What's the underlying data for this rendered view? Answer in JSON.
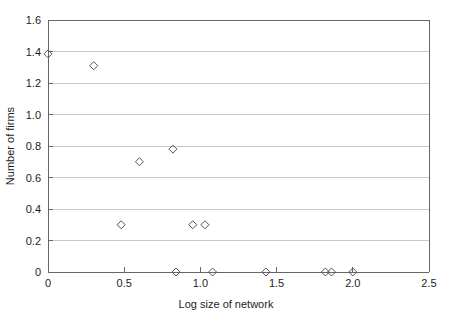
{
  "chart_data": {
    "type": "scatter",
    "title": "",
    "xlabel": "Log size of network",
    "ylabel": "Number of firms",
    "xlim": [
      0,
      2.5
    ],
    "ylim": [
      0,
      1.6
    ],
    "grid": "horizontal",
    "legend": "none",
    "marker": "open-diamond",
    "xticks": [
      "0",
      "0.5",
      "1.0",
      "1.5",
      "2.0",
      "2.5"
    ],
    "xtick_values": [
      0,
      0.5,
      1.0,
      1.5,
      2.0,
      2.5
    ],
    "yticks": [
      "0",
      "0.2",
      "0.4",
      "0.6",
      "0.8",
      "1.0",
      "1.2",
      "1.4",
      "1.6"
    ],
    "ytick_values": [
      0,
      0.2,
      0.4,
      0.6,
      0.8,
      1.0,
      1.2,
      1.4,
      1.6
    ],
    "points": [
      {
        "x": 0.0,
        "y": 1.385
      },
      {
        "x": 0.3,
        "y": 1.31
      },
      {
        "x": 0.48,
        "y": 0.3
      },
      {
        "x": 0.6,
        "y": 0.7
      },
      {
        "x": 0.82,
        "y": 0.78
      },
      {
        "x": 0.84,
        "y": 0.0
      },
      {
        "x": 0.95,
        "y": 0.3
      },
      {
        "x": 1.03,
        "y": 0.3
      },
      {
        "x": 1.08,
        "y": 0.0
      },
      {
        "x": 1.43,
        "y": 0.0
      },
      {
        "x": 1.82,
        "y": 0.0
      },
      {
        "x": 1.86,
        "y": 0.0
      },
      {
        "x": 2.0,
        "y": 0.0
      }
    ],
    "colors": {
      "marker_stroke": "#555555",
      "gridline": "#c8c8c8",
      "axis": "#666666",
      "background": "#ffffff",
      "text": "#1d1d1d"
    }
  }
}
